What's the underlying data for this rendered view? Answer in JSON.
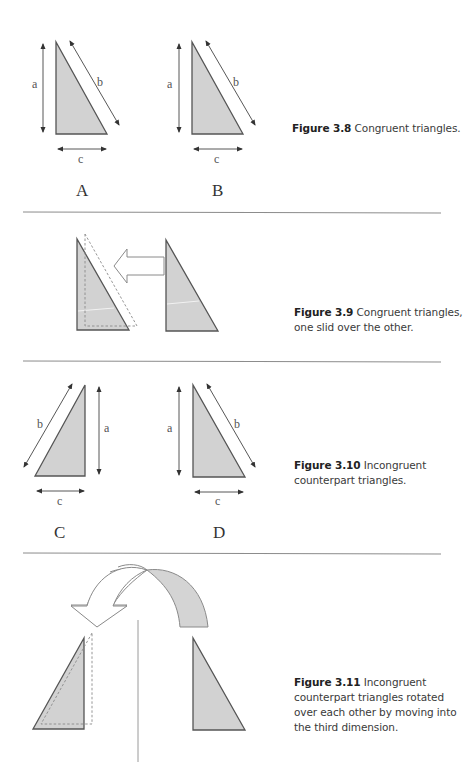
{
  "figures": [
    {
      "id": "3.8",
      "caption_number": "Figure 3.8",
      "caption_text": "Congruent triangles.",
      "labels": {
        "A": "A",
        "B": "B"
      },
      "sides": {
        "a": "a",
        "b": "b",
        "c": "c"
      }
    },
    {
      "id": "3.9",
      "caption_number": "Figure 3.9",
      "caption_text": "Congruent triangles,",
      "caption_line2": "one slid over the other."
    },
    {
      "id": "3.10",
      "caption_number": "Figure 3.10",
      "caption_text": "Incongruent",
      "caption_line2": "counterpart triangles.",
      "labels": {
        "C": "C",
        "D": "D"
      },
      "sides": {
        "a": "a",
        "b": "b",
        "c": "c"
      }
    },
    {
      "id": "3.11",
      "caption_number": "Figure 3.11",
      "caption_text": "Incongruent",
      "caption_line2": "counterpart triangles rotated",
      "caption_line3": "over each other by moving into",
      "caption_line4": "the third dimension."
    }
  ],
  "colors": {
    "triangle_fill": "#d2d2d2",
    "triangle_stroke": "#555555",
    "rule": "#8c8c8c",
    "caption_text": "#3a3a3a"
  }
}
